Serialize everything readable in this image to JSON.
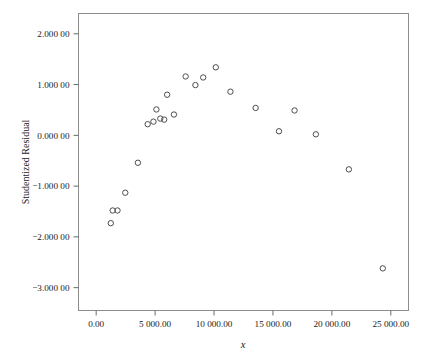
{
  "chart_data": {
    "type": "scatter",
    "title": "",
    "xlabel": "x",
    "ylabel": "Studentized Residual",
    "xlim": [
      -1500,
      26500
    ],
    "ylim": [
      -3.45,
      2.4
    ],
    "grid": false,
    "legend": "none",
    "marker": "open-circle",
    "marker_color": "#4d4d4d",
    "xticks": [
      0,
      5000,
      10000,
      15000,
      20000,
      25000
    ],
    "xtick_labels": [
      "0.00",
      "5 000.00",
      "10 000.00",
      "15 000.00",
      "20 000.00",
      "25 000.00"
    ],
    "yticks": [
      2,
      1,
      0,
      -1,
      -2,
      -3
    ],
    "ytick_labels": [
      "2.000 00",
      "1.000 00",
      "0.000 00",
      "−1.000 00",
      "−2.000 00",
      "−3.000 00"
    ],
    "points": [
      {
        "x": 1240,
        "y": -1.73
      },
      {
        "x": 1400,
        "y": -1.48
      },
      {
        "x": 1810,
        "y": -1.48
      },
      {
        "x": 2470,
        "y": -1.13
      },
      {
        "x": 3540,
        "y": -0.54
      },
      {
        "x": 4370,
        "y": 0.22
      },
      {
        "x": 4860,
        "y": 0.27
      },
      {
        "x": 5110,
        "y": 0.51
      },
      {
        "x": 5440,
        "y": 0.33
      },
      {
        "x": 5770,
        "y": 0.31
      },
      {
        "x": 6020,
        "y": 0.8
      },
      {
        "x": 6600,
        "y": 0.41
      },
      {
        "x": 7590,
        "y": 1.16
      },
      {
        "x": 8420,
        "y": 0.99
      },
      {
        "x": 9080,
        "y": 1.14
      },
      {
        "x": 10150,
        "y": 1.34
      },
      {
        "x": 11390,
        "y": 0.86
      },
      {
        "x": 13530,
        "y": 0.54
      },
      {
        "x": 15510,
        "y": 0.08
      },
      {
        "x": 16830,
        "y": 0.49
      },
      {
        "x": 18640,
        "y": 0.02
      },
      {
        "x": 21440,
        "y": -0.67
      },
      {
        "x": 24320,
        "y": -2.62
      }
    ]
  },
  "axes": {
    "y_title": "Studentized Residual",
    "x_title": "x"
  }
}
